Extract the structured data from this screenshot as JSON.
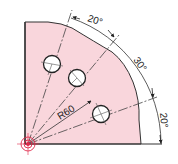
{
  "drawing": {
    "type": "technical-drawing",
    "description": "Quarter plate with three holes on a bolt circle, angular dimensions",
    "colors": {
      "plate_fill": "#f9d6dc",
      "outline": "#333333",
      "centerline": "#555555",
      "origin_mark": "#e0284a",
      "background": "#ffffff"
    },
    "radius_label": "R60",
    "angle_labels": [
      {
        "id": "top",
        "label": "20°"
      },
      {
        "id": "middle",
        "label": "30°"
      },
      {
        "id": "bottom",
        "label": "20°"
      }
    ],
    "radial_angles_deg": [
      20,
      50,
      70
    ],
    "holes": [
      {
        "id": "hole-1",
        "angle_deg": 70
      },
      {
        "id": "hole-2",
        "angle_deg": 50
      },
      {
        "id": "hole-3",
        "angle_deg": 20
      }
    ]
  }
}
